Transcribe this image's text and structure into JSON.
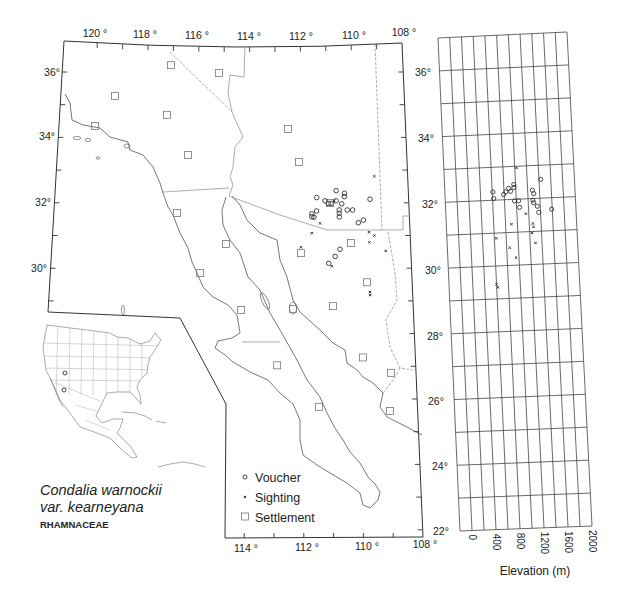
{
  "title": {
    "species": "Condalia warnockii",
    "variety": "var. kearneyana",
    "family": "RHAMNACEAE"
  },
  "legend": [
    {
      "symbol": "circle",
      "label": "Voucher"
    },
    {
      "symbol": "cross",
      "label": "Sighting"
    },
    {
      "symbol": "square",
      "label": "Settlement"
    }
  ],
  "map": {
    "lon_labels_top": [
      "120 °",
      "118 °",
      "116 °",
      "114 °",
      "112 °",
      "110 °",
      "108 °"
    ],
    "lon_labels_bottom": [
      "114 °",
      "112 °",
      "110 °",
      "108 °"
    ],
    "lat_labels_left": [
      "36°",
      "34°",
      "32°",
      "30°"
    ],
    "lat_labels_right": [
      "36°",
      "34°",
      "32°",
      "30°",
      "28°",
      "26°",
      "24°",
      "22°"
    ],
    "vouchers": [
      {
        "lon": -111.43,
        "lat": 32.16
      },
      {
        "lon": -111.12,
        "lat": 32.06
      },
      {
        "lon": -111.0,
        "lat": 31.98
      },
      {
        "lon": -110.9,
        "lat": 31.98
      },
      {
        "lon": -110.7,
        "lat": 32.37
      },
      {
        "lon": -110.71,
        "lat": 32.06
      },
      {
        "lon": -110.39,
        "lat": 32.29
      },
      {
        "lon": -110.4,
        "lat": 32.19
      },
      {
        "lon": -110.5,
        "lat": 31.97
      },
      {
        "lon": -110.6,
        "lat": 31.78
      },
      {
        "lon": -110.6,
        "lat": 31.68
      },
      {
        "lon": -110.6,
        "lat": 31.57
      },
      {
        "lon": -110.3,
        "lat": 31.78
      },
      {
        "lon": -110.1,
        "lat": 31.78
      },
      {
        "lon": -111.44,
        "lat": 31.75
      },
      {
        "lon": -111.62,
        "lat": 31.66
      },
      {
        "lon": -111.62,
        "lat": 31.57
      },
      {
        "lon": -111.54,
        "lat": 31.56
      },
      {
        "lon": -109.44,
        "lat": 32.11
      },
      {
        "lon": -109.9,
        "lat": 31.39
      },
      {
        "lon": -109.71,
        "lat": 31.47
      },
      {
        "lon": -110.6,
        "lat": 30.58
      },
      {
        "lon": -110.78,
        "lat": 30.36
      },
      {
        "lon": -111.02,
        "lat": 30.15
      }
    ],
    "sightings": [
      {
        "lon": -109.25,
        "lat": 32.81
      },
      {
        "lon": -111.32,
        "lat": 31.37
      },
      {
        "lon": -111.63,
        "lat": 31.07
      },
      {
        "lon": -109.51,
        "lat": 31.1
      },
      {
        "lon": -109.32,
        "lat": 31.0
      },
      {
        "lon": -112.03,
        "lat": 30.64
      },
      {
        "lon": -109.51,
        "lat": 30.79
      },
      {
        "lon": -108.92,
        "lat": 30.53
      },
      {
        "lon": -110.91,
        "lat": 30.06
      },
      {
        "lon": -109.54,
        "lat": 29.27
      },
      {
        "lon": -109.54,
        "lat": 29.18
      },
      {
        "lon": -110.78,
        "lat": 32.06
      }
    ],
    "settlements": [
      {
        "lon": -117.06,
        "lat": 36.21
      },
      {
        "lon": -115.18,
        "lat": 35.97
      },
      {
        "lon": -119.18,
        "lat": 35.27
      },
      {
        "lon": -117.14,
        "lat": 34.69
      },
      {
        "lon": -119.88,
        "lat": 34.35
      },
      {
        "lon": -116.29,
        "lat": 33.46
      },
      {
        "lon": -112.5,
        "lat": 34.26
      },
      {
        "lon": -112.08,
        "lat": 33.25
      },
      {
        "lon": -110.94,
        "lat": 31.99
      },
      {
        "lon": -116.63,
        "lat": 31.69
      },
      {
        "lon": -114.79,
        "lat": 30.74
      },
      {
        "lon": -112.03,
        "lat": 30.46
      },
      {
        "lon": -110.19,
        "lat": 30.77
      },
      {
        "lon": -115.71,
        "lat": 29.85
      },
      {
        "lon": -114.2,
        "lat": 28.72
      },
      {
        "lon": -112.33,
        "lat": 28.75
      },
      {
        "lon": -110.89,
        "lat": 28.84
      },
      {
        "lon": -109.64,
        "lat": 29.57
      },
      {
        "lon": -112.9,
        "lat": 27.03
      },
      {
        "lon": -109.86,
        "lat": 27.27
      },
      {
        "lon": -108.88,
        "lat": 26.8
      },
      {
        "lon": -111.44,
        "lat": 25.76
      },
      {
        "lon": -108.96,
        "lat": 25.63
      }
    ]
  },
  "chart_data": {
    "type": "scatter",
    "title": "",
    "xlabel": "Elevation (m)",
    "ylabel": "Latitude",
    "xlim": [
      -200,
      2000
    ],
    "ylim": [
      22,
      37
    ],
    "xticks": [
      0,
      400,
      800,
      1200,
      1600,
      2000
    ],
    "xtick_labels": [
      "0",
      "400",
      "800",
      "1200",
      "1600",
      "2000"
    ],
    "grid": true,
    "grid_step": {
      "elevation": 200,
      "latitude": 1
    },
    "series": [
      {
        "name": "Voucher",
        "marker": "circle",
        "points": [
          {
            "elevation": 1430,
            "lat": 32.57
          },
          {
            "elevation": 610,
            "lat": 32.25
          },
          {
            "elevation": 620,
            "lat": 32.05
          },
          {
            "elevation": 790,
            "lat": 32.16
          },
          {
            "elevation": 830,
            "lat": 32.24
          },
          {
            "elevation": 880,
            "lat": 32.34
          },
          {
            "elevation": 910,
            "lat": 32.25
          },
          {
            "elevation": 970,
            "lat": 32.45
          },
          {
            "elevation": 970,
            "lat": 32.36
          },
          {
            "elevation": 970,
            "lat": 31.95
          },
          {
            "elevation": 1040,
            "lat": 31.95
          },
          {
            "elevation": 1050,
            "lat": 31.75
          },
          {
            "elevation": 1280,
            "lat": 32.25
          },
          {
            "elevation": 1300,
            "lat": 32.15
          },
          {
            "elevation": 1280,
            "lat": 31.95
          },
          {
            "elevation": 1290,
            "lat": 31.87
          },
          {
            "elevation": 1350,
            "lat": 31.76
          },
          {
            "elevation": 1370,
            "lat": 31.57
          },
          {
            "elevation": 1590,
            "lat": 31.65
          }
        ]
      },
      {
        "name": "Sighting",
        "marker": "cross",
        "points": [
          {
            "elevation": 1030,
            "lat": 32.95
          },
          {
            "elevation": 1150,
            "lat": 31.55
          },
          {
            "elevation": 900,
            "lat": 31.25
          },
          {
            "elevation": 1260,
            "lat": 31.24
          },
          {
            "elevation": 1270,
            "lat": 31.14
          },
          {
            "elevation": 1240,
            "lat": 30.96
          },
          {
            "elevation": 630,
            "lat": 30.84
          },
          {
            "elevation": 1290,
            "lat": 30.65
          },
          {
            "elevation": 850,
            "lat": 30.54
          },
          {
            "elevation": 950,
            "lat": 30.23
          },
          {
            "elevation": 600,
            "lat": 29.44
          },
          {
            "elevation": 620,
            "lat": 29.35
          }
        ]
      }
    ]
  }
}
